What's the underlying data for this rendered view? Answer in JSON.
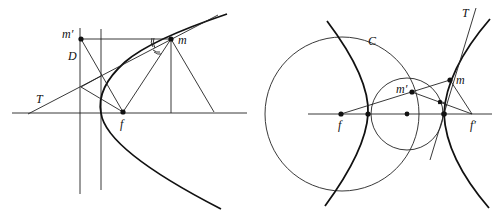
{
  "left_figure": {
    "title": "Parabola: focus, directrix and tangent",
    "labels": {
      "m_prime": "m′",
      "m": "m",
      "directrix": "D",
      "tangent": "T",
      "focus": "f"
    }
  },
  "right_figure": {
    "title": "Hyperbola: foci, director circle and tangent",
    "labels": {
      "circle": "C",
      "tangent": "T",
      "m": "m",
      "m_prime": "m′",
      "focus": "f",
      "focus_prime": "f′"
    }
  }
}
